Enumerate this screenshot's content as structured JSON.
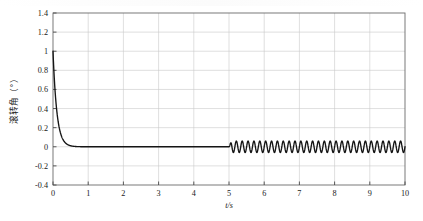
{
  "figure": {
    "background_color": "#ffffff",
    "plot_border_color": "#5a5a5a",
    "grid_color": "#c9c9c9",
    "curve_color": "#151515"
  },
  "axes": {
    "y_label": "滚转角（°）",
    "x_label": "t/s",
    "y_ticks": [
      "1.4",
      "1.2",
      "1",
      "0.8",
      "0.6",
      "0.4",
      "0.2",
      "0",
      "-0.2",
      "-0.4"
    ],
    "x_ticks": [
      "0",
      "1",
      "2",
      "3",
      "4",
      "5",
      "6",
      "7",
      "8",
      "9",
      "10"
    ]
  },
  "chart_data": {
    "type": "line",
    "title": "",
    "xlabel": "t/s",
    "ylabel": "滚转角（°）",
    "xlim": [
      0,
      10
    ],
    "ylim": [
      -0.4,
      1.4
    ],
    "grid": true,
    "legend": null,
    "y_tick_values": [
      1.4,
      1.2,
      1.0,
      0.8,
      0.6,
      0.4,
      0.2,
      0.0,
      -0.2,
      -0.4
    ],
    "x_tick_values": [
      0,
      1,
      2,
      3,
      4,
      5,
      6,
      7,
      8,
      9,
      10
    ],
    "series": [
      {
        "name": "滚转角",
        "color": "#151515",
        "description": "Exponential decay from 1.0 deg at t=0 to 0 deg by t≈0.6, flat at 0 until t=5, then sustained oscillation of amplitude ±0.06 deg at ≈6 Hz until t=10",
        "model": {
          "decay_initial_value": 1.0,
          "decay_time_constant": 0.11,
          "settle_time": 0.6,
          "steady_value": 0.0,
          "oscillation_start": 5.0,
          "oscillation_end": 10.0,
          "oscillation_amplitude": 0.06,
          "oscillation_frequency_hz": 6.0
        },
        "x": [
          0,
          0.05,
          0.1,
          0.15,
          0.2,
          0.25,
          0.3,
          0.35,
          0.4,
          0.5,
          0.6,
          0.8,
          1.0,
          1.5,
          2.0,
          2.5,
          3.0,
          3.5,
          4.0,
          4.5,
          5.0,
          6.0,
          7.0,
          8.0,
          9.0,
          10.0
        ],
        "y": [
          1.0,
          0.64,
          0.4,
          0.26,
          0.16,
          0.1,
          0.065,
          0.042,
          0.026,
          0.01,
          0.004,
          0.001,
          0.0,
          0.0,
          0.0,
          0.0,
          0.0,
          0.0,
          0.0,
          0.0,
          0.0,
          0.0,
          0.0,
          0.0,
          0.0,
          0.0
        ]
      }
    ]
  }
}
